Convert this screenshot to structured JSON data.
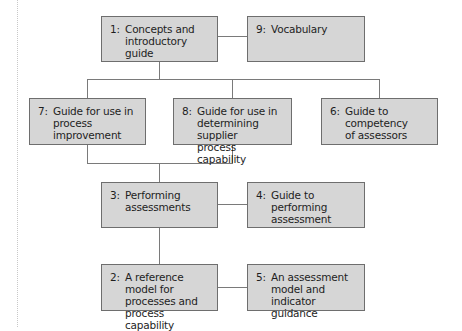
{
  "diagram": {
    "boxes": [
      {
        "id": "1",
        "num": "1:",
        "text": "Concepts and\nintroductory guide"
      },
      {
        "id": "9",
        "num": "9:",
        "text": "Vocabulary"
      },
      {
        "id": "7",
        "num": "7:",
        "text": "Guide for use in\nprocess improvement"
      },
      {
        "id": "8",
        "num": "8:",
        "text": "Guide for use in\ndetermining supplier\nprocess capability"
      },
      {
        "id": "6",
        "num": "6:",
        "text": "Guide to competency\nof assessors"
      },
      {
        "id": "3",
        "num": "3:",
        "text": "Performing\nassessments"
      },
      {
        "id": "4",
        "num": "4:",
        "text": "Guide to performing\nassessment"
      },
      {
        "id": "2",
        "num": "2:",
        "text": "A reference model for\nprocesses and\nprocess capability"
      },
      {
        "id": "5",
        "num": "5:",
        "text": "An assessment\nmodel and indicator\nguidance"
      }
    ],
    "connections": [
      [
        "1",
        "9"
      ],
      [
        "1",
        "7"
      ],
      [
        "1",
        "8"
      ],
      [
        "1",
        "6"
      ],
      [
        "7",
        "3"
      ],
      [
        "8",
        "3"
      ],
      [
        "3",
        "4"
      ],
      [
        "3",
        "2"
      ],
      [
        "2",
        "5"
      ]
    ],
    "colors": {
      "box_fill": "#d6d6d6",
      "box_border": "#6e6e6e",
      "connector": "#7a7a7a",
      "text": "#1e1e1e"
    }
  }
}
